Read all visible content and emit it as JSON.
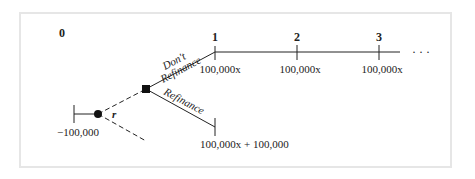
{
  "diagram": {
    "type": "decision-tree-timeline",
    "time_labels": [
      "0",
      "1",
      "2",
      "3"
    ],
    "ellipsis": "· · ·",
    "initial_cash_flow": "−100,000",
    "chance_node_label": "r",
    "branches": {
      "dont_refinance": {
        "label_line1": "Don't",
        "label_line2": "Refinance",
        "cash_flows": [
          "100,000x",
          "100,000x",
          "100,000x"
        ]
      },
      "refinance": {
        "label": "Refinance",
        "cash_flow": "100,000x + 100,000"
      }
    },
    "colors": {
      "line": "#222222",
      "border": "#e6e6e6"
    }
  }
}
